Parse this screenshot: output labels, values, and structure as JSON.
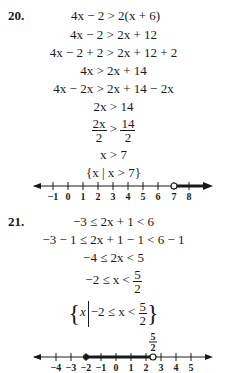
{
  "problems": [
    {
      "number": "20.",
      "steps": [
        "4x − 2 > 2(x + 6)",
        "4x − 2 > 2x + 12",
        "4x − 2 + 2 > 2x + 12 + 2",
        "4x > 2x + 14",
        "4x − 2x > 2x + 14 − 2x",
        "2x > 14",
        {
          "lhs_num": "2x",
          "lhs_den": "2",
          "op": ">",
          "rhs_num": "14",
          "rhs_den": "2"
        },
        "x > 7",
        "{x | x > 7}"
      ],
      "set_notation": {
        "var": "x",
        "condition": "x > 7"
      },
      "number_line": {
        "ticks": [
          "−1",
          "0",
          "1",
          "2",
          "3",
          "4",
          "5",
          "6",
          "7",
          "8"
        ],
        "open_point": "7",
        "ray": "right"
      }
    },
    {
      "number": "21.",
      "steps": [
        "−3 ≤ 2x + 1 < 6",
        "−3 − 1 ≤ 2x + 1 − 1 < 6 − 1",
        "−4 ≤ 2x < 5",
        {
          "left": "−2 ≤ x <",
          "num": "5",
          "den": "2"
        },
        {
          "var": "x",
          "condition_left": "−2 ≤ x <",
          "num": "5",
          "den": "2"
        }
      ],
      "number_line": {
        "ticks": [
          "−4",
          "−3",
          "−2",
          "−1",
          "0",
          "1",
          "2",
          "3",
          "4",
          "5"
        ],
        "closed_point": "−2",
        "open_point_label_num": "5",
        "open_point_label_den": "2"
      }
    }
  ]
}
